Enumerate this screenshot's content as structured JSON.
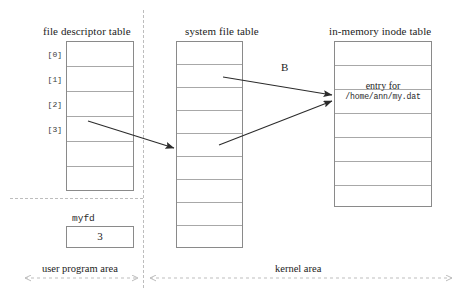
{
  "diagram": {
    "title_fd": "file descriptor table",
    "title_sft": "system file table",
    "title_inode": "in-memory inode table",
    "arrow_label_b": "B",
    "entry_caption": "entry for",
    "entry_path": "/home/ann/my.dat",
    "variable_name": "myfd",
    "variable_value": "3",
    "region_user": "user program area",
    "region_kernel": "kernel area",
    "fd_indices": [
      "[0]",
      "[1]",
      "[2]",
      "[3]"
    ],
    "colors": {
      "box_border": "#8a8a8a",
      "row_border": "#a8a8a8",
      "divider": "#bdbdbd",
      "arrow": "#2b2b2b",
      "text": "#1c1c1c",
      "background": "#ffffff"
    },
    "counts": {
      "fd_rows": 6,
      "sft_rows": 9,
      "inode_rows": 7
    }
  }
}
